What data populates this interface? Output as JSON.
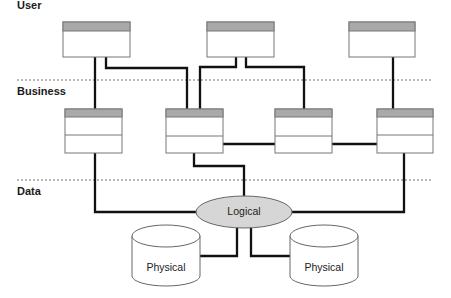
{
  "tiers": [
    {
      "label": "User"
    },
    {
      "label": "Business"
    },
    {
      "label": "Data"
    }
  ],
  "nodes": {
    "logical": {
      "label": "Logical"
    },
    "physical_left": {
      "label": "Physical"
    },
    "physical_right": {
      "label": "Physical"
    }
  },
  "colors": {
    "box_header": "#a9a9a9",
    "box_border": "#777777",
    "connector": "#111111",
    "separator": "#b8b8b8",
    "logical_fill": "#d6d6d6"
  }
}
